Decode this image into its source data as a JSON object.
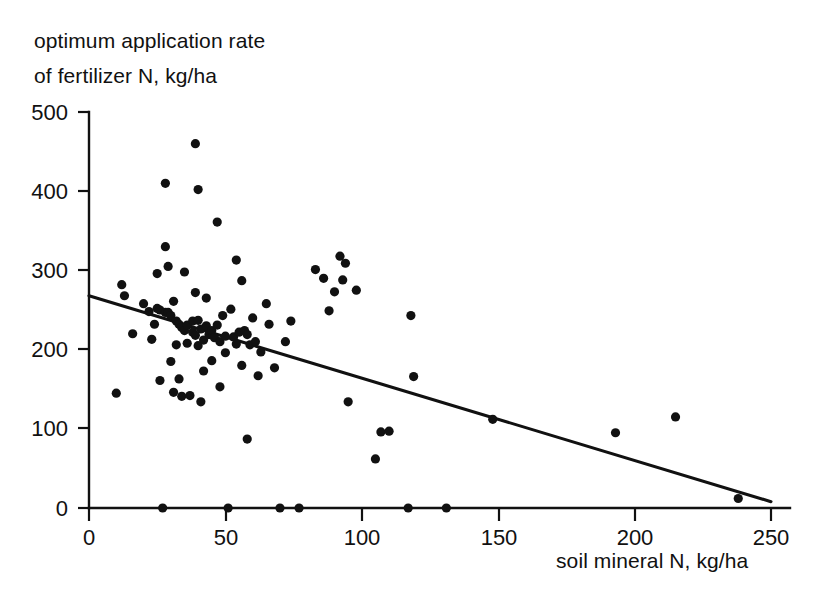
{
  "chart_data": {
    "type": "scatter",
    "title": "",
    "xlabel": "soil mineral N, kg/ha",
    "ylabel": "optimum application rate of fertilizer N, kg/ha",
    "ylabel_line1": "optimum application rate",
    "ylabel_line2": "of fertilizer N, kg/ha",
    "xlim": [
      0,
      250
    ],
    "ylim": [
      0,
      500
    ],
    "xticks": [
      0,
      50,
      100,
      150,
      200,
      250
    ],
    "yticks": [
      0,
      100,
      200,
      300,
      400,
      500
    ],
    "xtick_labels": [
      "0",
      "50",
      "100",
      "150",
      "200",
      "250"
    ],
    "ytick_labels": [
      "0",
      "100",
      "200",
      "300",
      "400",
      "500"
    ],
    "grid": false,
    "legend": false,
    "marker": "filled-circle",
    "marker_color": "#111111",
    "point_count": 96,
    "points": [
      [
        10,
        145
      ],
      [
        12,
        282
      ],
      [
        13,
        268
      ],
      [
        16,
        220
      ],
      [
        20,
        258
      ],
      [
        22,
        248
      ],
      [
        23,
        213
      ],
      [
        24,
        232
      ],
      [
        25,
        296
      ],
      [
        25,
        252
      ],
      [
        26,
        250
      ],
      [
        26,
        161
      ],
      [
        27,
        0
      ],
      [
        28,
        410
      ],
      [
        28,
        330
      ],
      [
        28,
        247
      ],
      [
        29,
        305
      ],
      [
        29,
        247
      ],
      [
        30,
        243
      ],
      [
        30,
        185
      ],
      [
        31,
        261
      ],
      [
        31,
        146
      ],
      [
        32,
        236
      ],
      [
        32,
        206
      ],
      [
        33,
        232
      ],
      [
        33,
        163
      ],
      [
        34,
        228
      ],
      [
        34,
        141
      ],
      [
        35,
        298
      ],
      [
        35,
        224
      ],
      [
        36,
        231
      ],
      [
        36,
        208
      ],
      [
        37,
        142
      ],
      [
        38,
        236
      ],
      [
        38,
        222
      ],
      [
        39,
        460
      ],
      [
        39,
        272
      ],
      [
        39,
        218
      ],
      [
        40,
        402
      ],
      [
        40,
        237
      ],
      [
        40,
        205
      ],
      [
        41,
        226
      ],
      [
        41,
        134
      ],
      [
        42,
        212
      ],
      [
        42,
        173
      ],
      [
        43,
        265
      ],
      [
        43,
        230
      ],
      [
        44,
        219
      ],
      [
        45,
        224
      ],
      [
        45,
        186
      ],
      [
        46,
        215
      ],
      [
        47,
        361
      ],
      [
        47,
        231
      ],
      [
        48,
        210
      ],
      [
        48,
        153
      ],
      [
        49,
        243
      ],
      [
        50,
        217
      ],
      [
        50,
        196
      ],
      [
        51,
        0
      ],
      [
        52,
        251
      ],
      [
        53,
        216
      ],
      [
        54,
        313
      ],
      [
        54,
        207
      ],
      [
        55,
        222
      ],
      [
        56,
        287
      ],
      [
        56,
        180
      ],
      [
        57,
        224
      ],
      [
        58,
        219
      ],
      [
        58,
        87
      ],
      [
        59,
        206
      ],
      [
        60,
        240
      ],
      [
        61,
        210
      ],
      [
        62,
        167
      ],
      [
        63,
        197
      ],
      [
        65,
        258
      ],
      [
        66,
        232
      ],
      [
        68,
        177
      ],
      [
        70,
        0
      ],
      [
        72,
        210
      ],
      [
        74,
        236
      ],
      [
        77,
        0
      ],
      [
        83,
        301
      ],
      [
        86,
        290
      ],
      [
        88,
        249
      ],
      [
        90,
        273
      ],
      [
        92,
        318
      ],
      [
        93,
        288
      ],
      [
        94,
        309
      ],
      [
        95,
        134
      ],
      [
        98,
        275
      ],
      [
        105,
        62
      ],
      [
        107,
        96
      ],
      [
        110,
        97
      ],
      [
        117,
        0
      ],
      [
        118,
        243
      ],
      [
        119,
        166
      ],
      [
        131,
        0
      ],
      [
        148,
        112
      ],
      [
        193,
        95
      ],
      [
        215,
        115
      ],
      [
        238,
        12
      ]
    ],
    "trendline": {
      "type": "linear-regression",
      "x_start": 0,
      "y_start": 268,
      "x_end": 250,
      "y_end": 8
    }
  }
}
